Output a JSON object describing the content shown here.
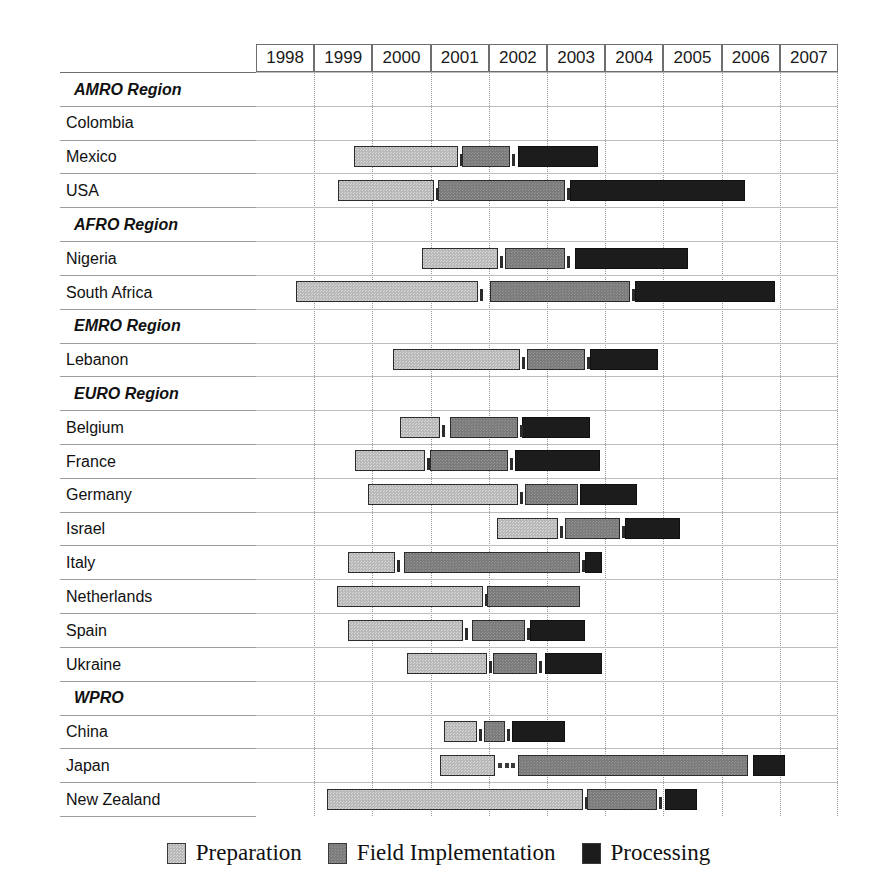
{
  "chart_data": {
    "type": "bar",
    "subtype": "gantt",
    "title": "",
    "xlabel": "",
    "ylabel": "",
    "axis": {
      "years": [
        "1998",
        "1999",
        "2000",
        "2001",
        "2002",
        "2003",
        "2004",
        "2005",
        "2006",
        "2007"
      ],
      "xlim": [
        1998,
        2008
      ],
      "grid": "dotted-vertical-year-boundaries"
    },
    "legend": {
      "position": "bottom-center",
      "entries": [
        {
          "label": "Preparation",
          "key": "prep",
          "color": "#b9b9b9"
        },
        {
          "label": "Field Implementation",
          "key": "field",
          "color": "#7b7b7b"
        },
        {
          "label": "Processing",
          "key": "proc",
          "color": "#1c1c1c"
        }
      ]
    },
    "rows": [
      {
        "label": "AMRO Region",
        "type": "region",
        "phases": []
      },
      {
        "label": "Colombia",
        "type": "country",
        "phases": [
          {
            "key": "prep",
            "start": 2002.88,
            "end": 2003.53
          },
          {
            "key": "field",
            "start": 2003.74,
            "end": 2004.05
          },
          {
            "key": "proc",
            "start": 2004.17,
            "end": 2005.97
          }
        ]
      },
      {
        "label": "Mexico",
        "type": "country",
        "phases": [
          {
            "key": "prep",
            "start": 2199,
            "end": 2199
          },
          {
            "key": "field",
            "start": 2199,
            "end": 2199
          },
          {
            "key": "proc",
            "start": 2199,
            "end": 2199
          }
        ],
        "px": [
          [
            354,
            458,
            "prep"
          ],
          [
            462,
            510,
            "field"
          ],
          [
            518,
            598,
            "proc"
          ]
        ]
      },
      {
        "label": "USA",
        "type": "country",
        "px": [
          [
            338,
            434,
            "prep"
          ],
          [
            438,
            565,
            "field"
          ],
          [
            570,
            745,
            "proc"
          ]
        ]
      },
      {
        "label": "AFRO Region",
        "type": "region",
        "px": []
      },
      {
        "label": "Nigeria",
        "type": "country",
        "px": [
          [
            422,
            498,
            "prep"
          ],
          [
            505,
            565,
            "field"
          ],
          [
            575,
            688,
            "proc"
          ]
        ]
      },
      {
        "label": "South Africa",
        "type": "country",
        "px": [
          [
            296,
            478,
            "prep"
          ],
          [
            490,
            630,
            "field"
          ],
          [
            635,
            775,
            "proc"
          ]
        ]
      },
      {
        "label": "EMRO Region",
        "type": "region",
        "px": []
      },
      {
        "label": "Lebanon",
        "type": "country",
        "px": [
          [
            393,
            520,
            "prep"
          ],
          [
            527,
            585,
            "field"
          ],
          [
            590,
            658,
            "proc"
          ]
        ]
      },
      {
        "label": "EURO Region",
        "type": "region",
        "px": []
      },
      {
        "label": "Belgium",
        "type": "country",
        "px": [
          [
            400,
            440,
            "prep"
          ],
          [
            450,
            518,
            "field"
          ],
          [
            522,
            590,
            "proc"
          ]
        ]
      },
      {
        "label": "France",
        "type": "country",
        "px": [
          [
            355,
            425,
            "prep"
          ],
          [
            430,
            508,
            "field"
          ],
          [
            515,
            600,
            "proc"
          ]
        ]
      },
      {
        "label": "Germany",
        "type": "country",
        "px": [
          [
            368,
            518,
            "prep"
          ],
          [
            525,
            578,
            "field"
          ],
          [
            580,
            637,
            "proc"
          ]
        ]
      },
      {
        "label": "Israel",
        "type": "country",
        "px": [
          [
            497,
            558,
            "prep"
          ],
          [
            565,
            620,
            "field"
          ],
          [
            625,
            680,
            "proc"
          ]
        ]
      },
      {
        "label": "Italy",
        "type": "country",
        "px": [
          [
            348,
            395,
            "prep"
          ],
          [
            404,
            580,
            "field"
          ],
          [
            585,
            602,
            "proc"
          ]
        ]
      },
      {
        "label": "Netherlands",
        "type": "country",
        "px": [
          [
            337,
            483,
            "prep"
          ],
          [
            487,
            580,
            "field"
          ]
        ]
      },
      {
        "label": "Spain",
        "type": "country",
        "px": [
          [
            348,
            463,
            "prep"
          ],
          [
            472,
            525,
            "field"
          ],
          [
            530,
            585,
            "proc"
          ]
        ]
      },
      {
        "label": "Ukraine",
        "type": "country",
        "px": [
          [
            407,
            487,
            "prep"
          ],
          [
            493,
            537,
            "field"
          ],
          [
            545,
            602,
            "proc"
          ]
        ]
      },
      {
        "label": "WPRO",
        "type": "region",
        "px": []
      },
      {
        "label": "China",
        "type": "country",
        "px": [
          [
            444,
            477,
            "prep"
          ],
          [
            484,
            505,
            "field"
          ],
          [
            512,
            565,
            "proc"
          ]
        ]
      },
      {
        "label": "Japan",
        "type": "country",
        "px": [
          [
            440,
            495,
            "prep"
          ],
          [
            518,
            748,
            "field"
          ],
          [
            753,
            785,
            "proc"
          ]
        ],
        "dots": [
          498,
          515
        ]
      },
      {
        "label": "New Zealand",
        "type": "country",
        "px": [
          [
            327,
            583,
            "prep"
          ],
          [
            587,
            657,
            "field"
          ],
          [
            665,
            697,
            "proc"
          ]
        ]
      }
    ]
  }
}
